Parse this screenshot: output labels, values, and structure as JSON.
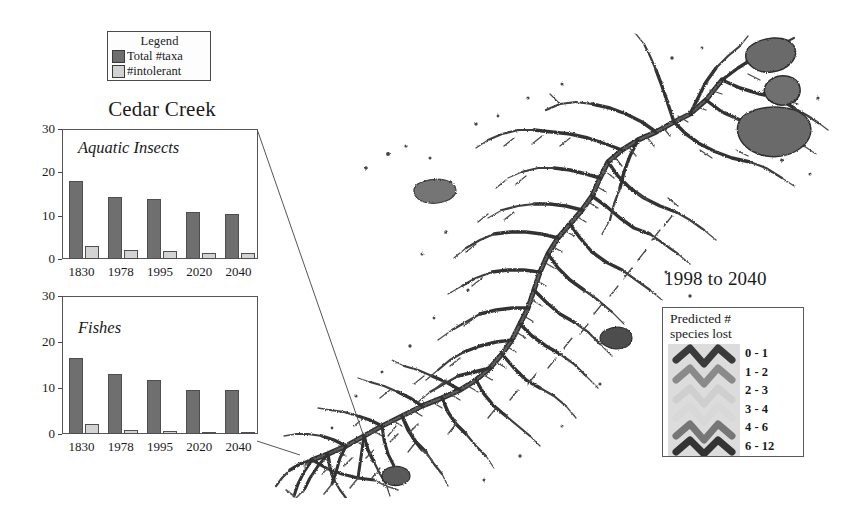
{
  "figure": {
    "panel_title": "Cedar Creek",
    "map_period_label": "1998 to 2040"
  },
  "chart_legend": {
    "title": "Legend",
    "items": [
      {
        "label": "Total #taxa",
        "swatch": "dark-square-swatch",
        "color": "#6e6e6e"
      },
      {
        "label": "#intolerant",
        "swatch": "light-square-swatch",
        "color": "#d2d2d2"
      }
    ]
  },
  "map_legend": {
    "title_line1": "Predicted #",
    "title_line2": "species lost",
    "classes": [
      {
        "label": "0 - 1",
        "color": "#3a3a3a"
      },
      {
        "label": "1 - 2",
        "color": "#8a8a8a"
      },
      {
        "label": "2 - 3",
        "color": "#c8c8c8"
      },
      {
        "label": "3 - 4",
        "color": "#d6d6d6"
      },
      {
        "label": "4 - 6",
        "color": "#767676"
      },
      {
        "label": "6 - 12",
        "color": "#333333"
      }
    ]
  },
  "chart_data": [
    {
      "type": "bar",
      "title": "Aquatic Insects",
      "xlabel": "",
      "ylabel": "",
      "ylim": [
        0,
        30
      ],
      "yticks": [
        0,
        10,
        20,
        30
      ],
      "grid": false,
      "legend_position": "external-top-left",
      "categories": [
        "1830",
        "1978",
        "1995",
        "2020",
        "2040"
      ],
      "series": [
        {
          "name": "Total #taxa",
          "values": [
            18.1,
            14.2,
            13.8,
            10.8,
            10.4
          ]
        },
        {
          "name": "#intolerant",
          "values": [
            2.9,
            2.1,
            1.9,
            1.3,
            1.3
          ]
        }
      ]
    },
    {
      "type": "bar",
      "title": "Fishes",
      "xlabel": "",
      "ylabel": "",
      "ylim": [
        0,
        30
      ],
      "yticks": [
        0,
        10,
        20,
        30
      ],
      "grid": false,
      "legend_position": "external-top-left",
      "categories": [
        "1830",
        "1978",
        "1995",
        "2020",
        "2040"
      ],
      "series": [
        {
          "name": "Total #taxa",
          "values": [
            16.6,
            13.0,
            11.7,
            9.5,
            9.5
          ]
        },
        {
          "name": "#intolerant",
          "values": [
            2.1,
            0.9,
            0.7,
            0.15,
            0.15
          ]
        }
      ]
    }
  ]
}
